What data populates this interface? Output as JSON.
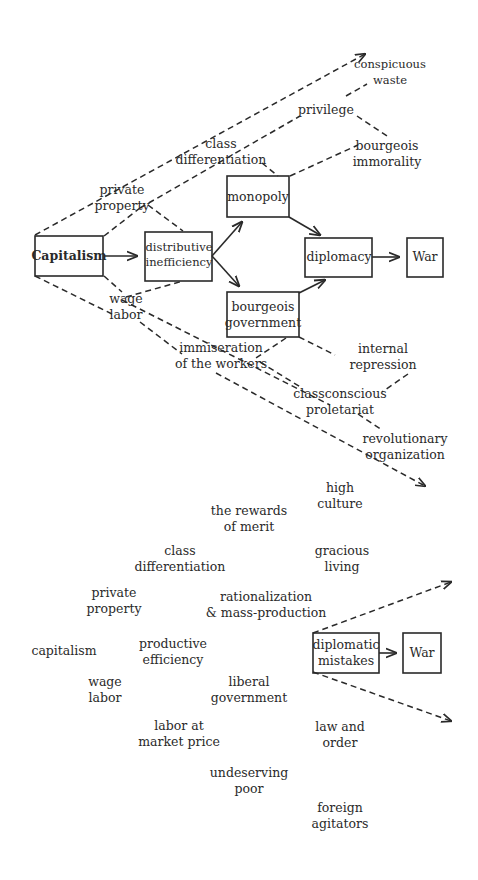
{
  "upper_diagram": {
    "boxes": {
      "capitalism": "Capitalism",
      "distributive_inefficiency": [
        "distributive",
        "inefficiency"
      ],
      "monopoly": "monopoly",
      "diplomacy": "diplomacy",
      "war": "War",
      "bourgeois_government": [
        "bourgeois",
        "government"
      ]
    },
    "labels": {
      "conspicuous_waste": [
        "conspicuous",
        "waste"
      ],
      "privilege": "privilege",
      "bourgeois_immorality": [
        "bourgeois",
        "immorality"
      ],
      "class_differentiation": [
        "class",
        "differentiation"
      ],
      "private_property": [
        "private",
        "property"
      ],
      "wage_labor": [
        "wage",
        "labor"
      ],
      "immiseration": [
        "immiseration",
        "of the workers"
      ],
      "internal_repression": [
        "internal",
        "repression"
      ],
      "classconscious_proletariat": [
        "classconscious",
        "proletariat"
      ],
      "revolutionary_organization": [
        "revolutionary",
        "organization"
      ]
    }
  },
  "lower_diagram": {
    "boxes": {
      "diplomatic_mistakes": [
        "diplomatic",
        "mistakes"
      ],
      "war": "War"
    },
    "labels": {
      "high_culture": [
        "high",
        "culture"
      ],
      "rewards_of_merit": [
        "the rewards",
        "of merit"
      ],
      "class_differentiation": [
        "class",
        "differentiation"
      ],
      "gracious_living": [
        "gracious",
        "living"
      ],
      "private_property": [
        "private",
        "property"
      ],
      "rationalization": [
        "rationalization",
        "& mass-production"
      ],
      "capitalism": "capitalism",
      "productive_efficiency": [
        "productive",
        "efficiency"
      ],
      "wage_labor": [
        "wage",
        "labor"
      ],
      "liberal_government": [
        "liberal",
        "government"
      ],
      "labor_at_market_price": [
        "labor at",
        "market price"
      ],
      "law_and_order": [
        "law and",
        "order"
      ],
      "undeserving_poor": [
        "undeserving",
        "poor"
      ],
      "foreign_agitators": [
        "foreign",
        "agitators"
      ]
    }
  },
  "colors": {
    "ink": "#2a2a2a",
    "background": "#ffffff"
  }
}
